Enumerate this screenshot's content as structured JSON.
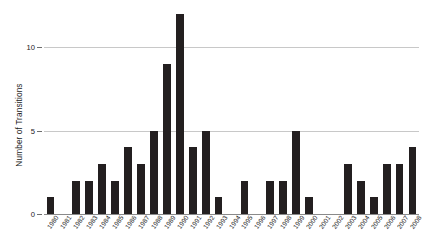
{
  "chart_data": {
    "type": "bar",
    "title": "",
    "subtitle": "",
    "xlabel": "",
    "ylabel": "Number of Transitions",
    "ylim": [
      0,
      12.6
    ],
    "yticks": [
      0,
      5,
      10
    ],
    "ytick_labels": [
      "0",
      "5",
      "10"
    ],
    "grid": true,
    "legend": null,
    "bar_color": "#231f20",
    "gridline_color": "#c8c8c8",
    "axis_color": "#8a8a8a",
    "categories": [
      "1980",
      "1981",
      "1982",
      "1983",
      "1984",
      "1985",
      "1986",
      "1987",
      "1988",
      "1989",
      "1990",
      "1991",
      "1992",
      "1993",
      "1994",
      "1995",
      "1996",
      "1997",
      "1998",
      "1999",
      "2000",
      "2001",
      "2002",
      "2003",
      "2004",
      "2005",
      "2006",
      "2007",
      "2008"
    ],
    "values": [
      1,
      0,
      2,
      2,
      3,
      2,
      4,
      3,
      5,
      9,
      12,
      4,
      5,
      1,
      0,
      2,
      0,
      2,
      2,
      5,
      1,
      0,
      0,
      3,
      2,
      1,
      3,
      3,
      4
    ]
  }
}
